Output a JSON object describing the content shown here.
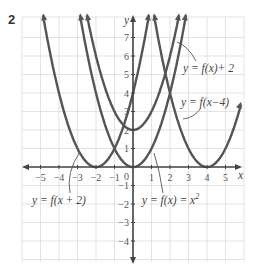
{
  "figure_number": "2",
  "chart_data": {
    "type": "line",
    "title": "",
    "xlabel": "x",
    "ylabel": "y",
    "xlim": [
      -6,
      6
    ],
    "ylim": [
      -5,
      7.5
    ],
    "grid": true,
    "x_ticks": [
      -5,
      -4,
      -3,
      -2,
      -1,
      0,
      1,
      2,
      3,
      4,
      5
    ],
    "y_ticks": [
      -4,
      -3,
      -2,
      -1,
      1,
      2,
      3,
      4,
      5,
      6,
      7
    ],
    "series": [
      {
        "name": "y = f(x) = x²",
        "h": 0,
        "k": 0,
        "vertex": [
          0,
          0
        ]
      },
      {
        "name": "y = f(x) + 2",
        "h": 0,
        "k": 2,
        "vertex": [
          0,
          2
        ]
      },
      {
        "name": "y = f(x−4)",
        "h": 4,
        "k": 0,
        "vertex": [
          4,
          0
        ]
      },
      {
        "name": "y = f(x + 2)",
        "h": -2,
        "k": 0,
        "vertex": [
          -2,
          0
        ]
      }
    ],
    "annotations": [
      {
        "text": "y = f(x)+ 2",
        "x": 1.8,
        "y": 5.8
      },
      {
        "text": "y = f(x−4)",
        "x": 2.4,
        "y": 3.5
      },
      {
        "text": "y = f(x + 2)",
        "x": -5.5,
        "y": -1.3
      },
      {
        "text": "y = f(x) = x",
        "sup": "2",
        "x": -0.4,
        "y": -1.3
      }
    ]
  },
  "labels": {
    "fx_plus_2": "y = f(x)+ 2",
    "fx_minus_4": "y = f(x−4)",
    "fx_plus_2_shift": "y = f(x + 2)",
    "fx_base": "y = f(x) = x",
    "fx_base_sup": "2",
    "x_axis": "x",
    "y_axis": "y"
  }
}
